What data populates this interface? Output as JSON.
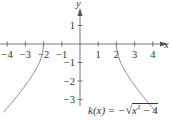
{
  "chart_data": {
    "type": "line",
    "title": "",
    "xlabel": "x",
    "ylabel": "y",
    "xlim": [
      -4.3,
      4.5
    ],
    "ylim": [
      -3.5,
      2.2
    ],
    "x_ticks": [
      "-4",
      "-3",
      "-2",
      "-1",
      "1",
      "2",
      "3",
      "4"
    ],
    "y_ticks": [
      "1",
      "-1",
      "-2",
      "-3"
    ],
    "grid": false,
    "annotation": "k(x) = −√(x² − 4)",
    "series": [
      {
        "name": "k(x) left branch",
        "x": [
          -4.2,
          -4,
          -3.5,
          -3,
          -2.5,
          -2.2,
          -2.05,
          -2
        ],
        "y": [
          -3.69,
          -3.46,
          -2.87,
          -2.24,
          -1.5,
          -0.92,
          -0.45,
          0
        ]
      },
      {
        "name": "k(x) right branch",
        "x": [
          2,
          2.05,
          2.2,
          2.5,
          3,
          3.5,
          4,
          4.2
        ],
        "y": [
          0,
          -0.45,
          -0.92,
          -1.5,
          -2.24,
          -2.87,
          -3.46,
          -3.69
        ]
      }
    ]
  },
  "labels": {
    "x_axis": "x",
    "y_axis": "y",
    "equation_lhs": "k(x) = −",
    "equation_rad": "x",
    "equation_exp": "2",
    "equation_rest": " − 4"
  }
}
